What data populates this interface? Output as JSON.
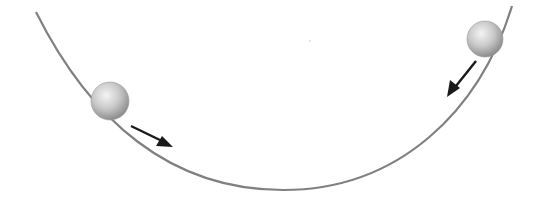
{
  "diagram": {
    "colors": {
      "bowl": "#808080",
      "ball_light": "#f2f2f2",
      "ball_dark": "#9a9a9a",
      "arrow": "#1a1a1a",
      "background": "#ffffff"
    },
    "elements": [
      {
        "name": "bowl-curve",
        "type": "curve"
      },
      {
        "name": "ball-left",
        "type": "ball",
        "cx": 110,
        "cy": 101,
        "r": 19
      },
      {
        "name": "arrow-left",
        "type": "arrow",
        "direction": "down-right"
      },
      {
        "name": "ball-right",
        "type": "ball",
        "cx": 485,
        "cy": 39,
        "r": 18
      },
      {
        "name": "arrow-right",
        "type": "arrow",
        "direction": "down-left"
      }
    ]
  }
}
